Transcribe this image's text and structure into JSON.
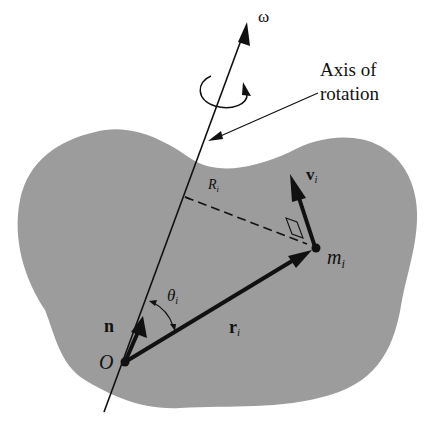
{
  "diagram": {
    "type": "rigid-body-rotation",
    "colors": {
      "background": "#ffffff",
      "body_fill": "#9c9c9c",
      "ink": "#111111"
    },
    "labels": {
      "omega": "ω",
      "axis_line1": "Axis of",
      "axis_line2": "rotation",
      "R": "R",
      "R_sub": "i",
      "v": "v",
      "v_sub": "i",
      "m": "m",
      "m_sub": "i",
      "theta": "θ",
      "theta_sub": "i",
      "n": "n",
      "r": "r",
      "r_sub": "i",
      "origin": "O"
    },
    "elements": [
      "rotation-axis-arrow",
      "rotation-direction-curl",
      "axis-callout-pointer",
      "rigid-body-shape",
      "unit-vector-n",
      "position-vector-r-i",
      "velocity-vector-v-i",
      "perpendicular-distance-R-i",
      "right-angle-marker",
      "angle-theta-i-arc",
      "mass-point-m-i",
      "origin-point-O"
    ]
  }
}
